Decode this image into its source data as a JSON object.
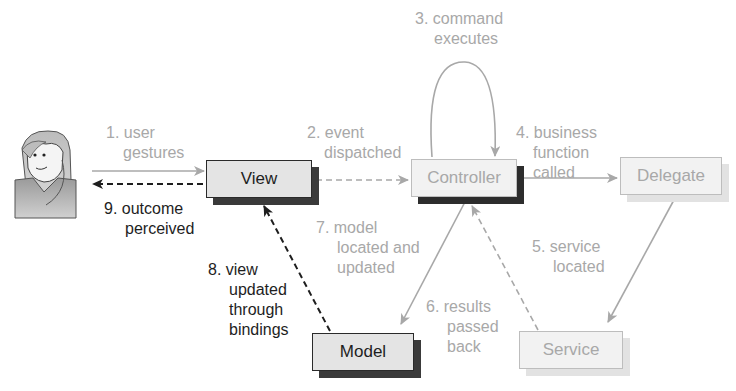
{
  "nodes": {
    "view": "View",
    "controller": "Controller",
    "delegate": "Delegate",
    "model": "Model",
    "service": "Service"
  },
  "steps": [
    {
      "id": 1,
      "text_lines": [
        "1. user",
        "gestures"
      ],
      "style": "light"
    },
    {
      "id": 2,
      "text_lines": [
        "2. event",
        "dispatched"
      ],
      "style": "light"
    },
    {
      "id": 3,
      "text_lines": [
        "3. command",
        "executes"
      ],
      "style": "light"
    },
    {
      "id": 4,
      "text_lines": [
        "4. business",
        "function",
        "called"
      ],
      "style": "light"
    },
    {
      "id": 5,
      "text_lines": [
        "5. service",
        "located"
      ],
      "style": "light"
    },
    {
      "id": 6,
      "text_lines": [
        "6. results",
        "passed",
        "back"
      ],
      "style": "light"
    },
    {
      "id": 7,
      "text_lines": [
        "7. model",
        "located and",
        "updated"
      ],
      "style": "light"
    },
    {
      "id": 8,
      "text_lines": [
        "8. view",
        "updated",
        "through",
        "bindings"
      ],
      "style": "dark"
    },
    {
      "id": 9,
      "text_lines": [
        "9. outcome",
        "perceived"
      ],
      "style": "dark"
    }
  ],
  "actor": {
    "icon": "user-avatar-icon"
  },
  "colors": {
    "light": "#a8a8a8",
    "dark": "#1e1e1e"
  }
}
